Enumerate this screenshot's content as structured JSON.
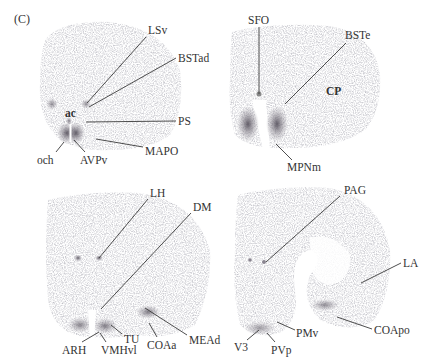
{
  "figure": {
    "panel_label": "(C)",
    "sections": [
      {
        "id": "top-left",
        "labels": [
          {
            "text": "LSv",
            "x": 148,
            "y": 24,
            "bold": false,
            "line": [
              [
                146,
                37
              ],
              [
                87,
                103
              ]
            ]
          },
          {
            "text": "BSTad",
            "x": 178,
            "y": 52,
            "bold": false,
            "line": [
              [
                176,
                58
              ],
              [
                89,
                107
              ]
            ]
          },
          {
            "text": "ac",
            "x": 65,
            "y": 107,
            "bold": true,
            "line": null
          },
          {
            "text": "PS",
            "x": 178,
            "y": 115,
            "bold": false,
            "line": [
              [
                176,
                121
              ],
              [
                86,
                122
              ]
            ]
          },
          {
            "text": "MAPO",
            "x": 145,
            "y": 145,
            "bold": false,
            "line": [
              [
                143,
                147
              ],
              [
                96,
                139
              ]
            ]
          },
          {
            "text": "och",
            "x": 37,
            "y": 154,
            "bold": false,
            "line": [
              [
                56,
                152
              ],
              [
                64,
                142
              ]
            ]
          },
          {
            "text": "AVPv",
            "x": 80,
            "y": 154,
            "bold": false,
            "line": [
              [
                85,
                152
              ],
              [
                74,
                140
              ]
            ]
          }
        ]
      },
      {
        "id": "top-right",
        "labels": [
          {
            "text": "SFO",
            "x": 248,
            "y": 14,
            "bold": false,
            "line": [
              [
                259,
                27
              ],
              [
                259,
                94
              ]
            ]
          },
          {
            "text": "BSTe",
            "x": 345,
            "y": 29,
            "bold": false,
            "line": [
              [
                346,
                43
              ],
              [
                285,
                104
              ]
            ]
          },
          {
            "text": "CP",
            "x": 326,
            "y": 85,
            "bold": true,
            "line": null
          },
          {
            "text": "MPNm",
            "x": 287,
            "y": 161,
            "bold": false,
            "line": [
              [
                292,
                160
              ],
              [
                276,
                144
              ]
            ]
          }
        ]
      },
      {
        "id": "bottom-left",
        "labels": [
          {
            "text": "LH",
            "x": 150,
            "y": 187,
            "bold": false,
            "line": [
              [
                148,
                199
              ],
              [
                99,
                258
              ]
            ]
          },
          {
            "text": "DM",
            "x": 193,
            "y": 201,
            "bold": false,
            "line": [
              [
                191,
                213
              ],
              [
                101,
                309
              ]
            ]
          },
          {
            "text": "MEAd",
            "x": 189,
            "y": 334,
            "bold": false,
            "line": [
              [
                187,
                335
              ],
              [
                145,
                308
              ]
            ]
          },
          {
            "text": "TU",
            "x": 124,
            "y": 333,
            "bold": false,
            "line": [
              [
                122,
                334
              ],
              [
                111,
                325
              ]
            ]
          },
          {
            "text": "COAa",
            "x": 147,
            "y": 339,
            "bold": false,
            "line": [
              [
                157,
                337
              ],
              [
                149,
                323
              ]
            ]
          },
          {
            "text": "ARH",
            "x": 62,
            "y": 344,
            "bold": false,
            "line": [
              [
                82,
                342
              ],
              [
                99,
                332
              ]
            ]
          },
          {
            "text": "VMHvl",
            "x": 101,
            "y": 344,
            "bold": false,
            "line": [
              [
                106,
                342
              ],
              [
                100,
                333
              ]
            ]
          }
        ]
      },
      {
        "id": "bottom-right",
        "labels": [
          {
            "text": "PAG",
            "x": 344,
            "y": 184,
            "bold": false,
            "line": [
              [
                340,
                196
              ],
              [
                266,
                262
              ]
            ]
          },
          {
            "text": "LA",
            "x": 403,
            "y": 257,
            "bold": false,
            "line": [
              [
                401,
                263
              ],
              [
                361,
                283
              ]
            ]
          },
          {
            "text": "PMv",
            "x": 296,
            "y": 327,
            "bold": false,
            "line": [
              [
                295,
                330
              ],
              [
                277,
                322
              ]
            ]
          },
          {
            "text": "COApo",
            "x": 374,
            "y": 324,
            "bold": false,
            "line": [
              [
                372,
                329
              ],
              [
                337,
                317
              ]
            ]
          },
          {
            "text": "V3",
            "x": 234,
            "y": 341,
            "bold": false,
            "line": [
              [
                247,
                340
              ],
              [
                259,
                330
              ]
            ]
          },
          {
            "text": "PVp",
            "x": 271,
            "y": 344,
            "bold": false,
            "line": [
              [
                275,
                342
              ],
              [
                267,
                333
              ]
            ]
          }
        ]
      }
    ]
  }
}
